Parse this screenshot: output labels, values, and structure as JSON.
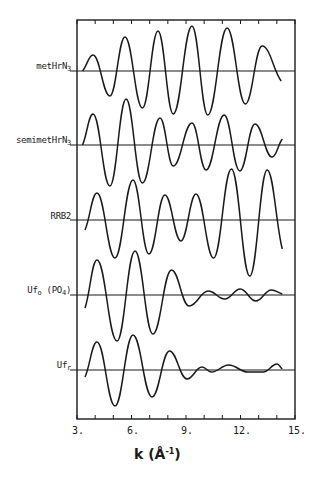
{
  "chart_data": {
    "type": "line",
    "title": "",
    "xlabel": "k (Å^-1)",
    "xlabel_parts": {
      "main": "k  (Å",
      "sup": "-1",
      "close": ")"
    },
    "ylabel": "",
    "xlim": [
      3,
      15
    ],
    "xticks": [
      3,
      6,
      9,
      12,
      15
    ],
    "xtick_labels": [
      "3.",
      "6.",
      "9.",
      "12.",
      "15."
    ],
    "minor_tick_step": 1,
    "grid": false,
    "legend": "none (traces labeled on left)",
    "offset_traces": true,
    "series": [
      {
        "name": "metHrN3",
        "label_main": "metHrN",
        "label_sub": "3",
        "label_suffix": "",
        "baseline_px": 71,
        "points_k_amp": [
          [
            3.3,
            0
          ],
          [
            3.88,
            16
          ],
          [
            4.81,
            -25
          ],
          [
            5.64,
            34
          ],
          [
            6.6,
            -37
          ],
          [
            7.46,
            40
          ],
          [
            8.3,
            -43
          ],
          [
            9.33,
            45
          ],
          [
            10.2,
            -44
          ],
          [
            11.26,
            43
          ],
          [
            12.27,
            -33
          ],
          [
            13.19,
            25
          ],
          [
            14.24,
            -10
          ]
        ]
      },
      {
        "name": "semimetHrN3",
        "label_main": "semimetHrN",
        "label_sub": "3",
        "label_suffix": "",
        "baseline_px": 145,
        "points_k_amp": [
          [
            3.3,
            0
          ],
          [
            3.88,
            31
          ],
          [
            4.81,
            -41
          ],
          [
            5.7,
            46
          ],
          [
            6.6,
            -38
          ],
          [
            7.57,
            27
          ],
          [
            8.3,
            -21
          ],
          [
            9.33,
            22
          ],
          [
            10.1,
            -25
          ],
          [
            11.1,
            30
          ],
          [
            11.96,
            -26
          ],
          [
            12.8,
            21
          ],
          [
            13.74,
            -12
          ],
          [
            14.3,
            6
          ]
        ]
      },
      {
        "name": "RRB2",
        "label_main": "RRB2",
        "label_sub": "",
        "label_suffix": "",
        "baseline_px": 220,
        "points_k_amp": [
          [
            3.44,
            -10
          ],
          [
            4.1,
            27
          ],
          [
            5.09,
            -38
          ],
          [
            6.08,
            40
          ],
          [
            6.96,
            -34
          ],
          [
            7.84,
            25
          ],
          [
            8.72,
            -21
          ],
          [
            9.55,
            26
          ],
          [
            10.52,
            -38
          ],
          [
            11.5,
            51
          ],
          [
            12.51,
            -56
          ],
          [
            13.47,
            50
          ],
          [
            14.3,
            -29
          ]
        ]
      },
      {
        "name": "Uf_o (PO4)",
        "label_main": "Uf",
        "label_sub": "o",
        "label_suffix": " (PO",
        "label_sub2": "4",
        "label_suffix2": ")",
        "baseline_px": 295,
        "points_k_amp": [
          [
            3.44,
            -13
          ],
          [
            4.1,
            35
          ],
          [
            5.2,
            -46
          ],
          [
            6.19,
            44
          ],
          [
            7.18,
            -39
          ],
          [
            8.2,
            25
          ],
          [
            9.17,
            -11
          ],
          [
            10.23,
            4
          ],
          [
            11.13,
            -4
          ],
          [
            11.99,
            6
          ],
          [
            12.84,
            -6
          ],
          [
            13.7,
            5
          ],
          [
            14.3,
            1
          ]
        ]
      },
      {
        "name": "Uf_r",
        "label_main": "Uf",
        "label_sub": "r",
        "label_suffix": "",
        "baseline_px": 370,
        "points_k_amp": [
          [
            3.44,
            -7
          ],
          [
            4.1,
            28
          ],
          [
            5.09,
            -36
          ],
          [
            6.08,
            35
          ],
          [
            7.13,
            -27
          ],
          [
            8.09,
            19
          ],
          [
            9.06,
            -9
          ],
          [
            9.88,
            3
          ],
          [
            10.4,
            -2
          ],
          [
            11.35,
            5
          ],
          [
            12.4,
            -2
          ],
          [
            13.25,
            -2
          ],
          [
            14.02,
            6
          ],
          [
            14.3,
            1
          ]
        ]
      }
    ],
    "frame_px": {
      "left": 77,
      "right": 295,
      "top": 20,
      "bottom": 419
    },
    "line_color": "#1a1a1a"
  }
}
